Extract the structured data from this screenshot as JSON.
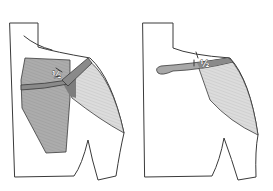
{
  "figures": [
    {
      "id": "left",
      "description": "Shoulder with wide dark-shaded region and diagonal strap",
      "marker_label": "½",
      "colors": {
        "dark_region": "#a9a9a9",
        "light_region": "#d9d9d9",
        "strap": "#8a8a8a",
        "outline": "#3a3a3a"
      }
    },
    {
      "id": "right",
      "description": "Shoulder with horizontal strap extending left and light-shaded region",
      "marker_label": "½",
      "colors": {
        "light_region": "#d6d6d6",
        "strap": "#8f8f8f",
        "outline": "#3a3a3a"
      }
    }
  ]
}
